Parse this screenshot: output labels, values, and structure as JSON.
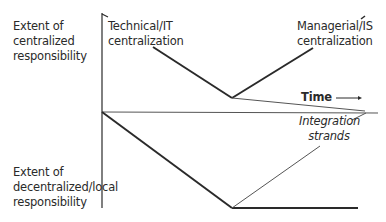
{
  "diagram": {
    "y_axis_top_label": [
      "Extent of",
      "centralized",
      "responsibility"
    ],
    "y_axis_bottom_label": [
      "Extent of",
      "decentralized/local",
      "responsibility"
    ],
    "x_axis_label": "Time",
    "curves": {
      "technical": [
        "Technical/IT",
        "centralization"
      ],
      "managerial": [
        "Managerial/IS",
        "centralization"
      ],
      "integration": [
        "Integration",
        "strands"
      ]
    },
    "colors": {
      "line": "#2a2a2a",
      "thin_line": "#555555",
      "text": "#2a2a2a"
    }
  }
}
